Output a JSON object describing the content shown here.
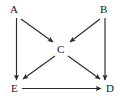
{
  "diagram": {
    "type": "directed-graph",
    "background_color": "#ffffff",
    "stroke_color": "#2b2b2b",
    "label_color": "#1a1a1a",
    "nodes": [
      {
        "id": "A",
        "label": "A",
        "x": 13,
        "y": 10
      },
      {
        "id": "B",
        "label": "B",
        "x": 103,
        "y": 10
      },
      {
        "id": "C",
        "label": "C",
        "x": 58,
        "y": 49
      },
      {
        "id": "D",
        "label": "D",
        "x": 107,
        "y": 88
      },
      {
        "id": "E",
        "label": "E",
        "x": 12,
        "y": 88
      }
    ],
    "edges": [
      {
        "id": "A-E",
        "from": "A",
        "to": "E",
        "kind": "straight",
        "x1": 16.5,
        "y1": 18,
        "x2": 16.5,
        "y2": 80
      },
      {
        "id": "A-C",
        "from": "A",
        "to": "C",
        "kind": "straight",
        "x1": 21,
        "y1": 19,
        "x2": 53,
        "y2": 42
      },
      {
        "id": "B-C",
        "from": "B",
        "to": "C",
        "kind": "straight",
        "x1": 100,
        "y1": 19,
        "x2": 70,
        "y2": 42
      },
      {
        "id": "B-D",
        "from": "B",
        "to": "D",
        "kind": "straight",
        "x1": 105,
        "y1": 18,
        "x2": 105,
        "y2": 80
      },
      {
        "id": "C-E",
        "from": "C",
        "to": "E",
        "kind": "straight",
        "x1": 55,
        "y1": 56,
        "x2": 23,
        "y2": 79
      },
      {
        "id": "C-D",
        "from": "C",
        "to": "D",
        "kind": "straight",
        "x1": 68,
        "y1": 56,
        "x2": 100,
        "y2": 79
      },
      {
        "id": "E-D",
        "from": "E",
        "to": "D",
        "kind": "straight",
        "x1": 22,
        "y1": 88.5,
        "x2": 101,
        "y2": 88.5
      }
    ]
  }
}
